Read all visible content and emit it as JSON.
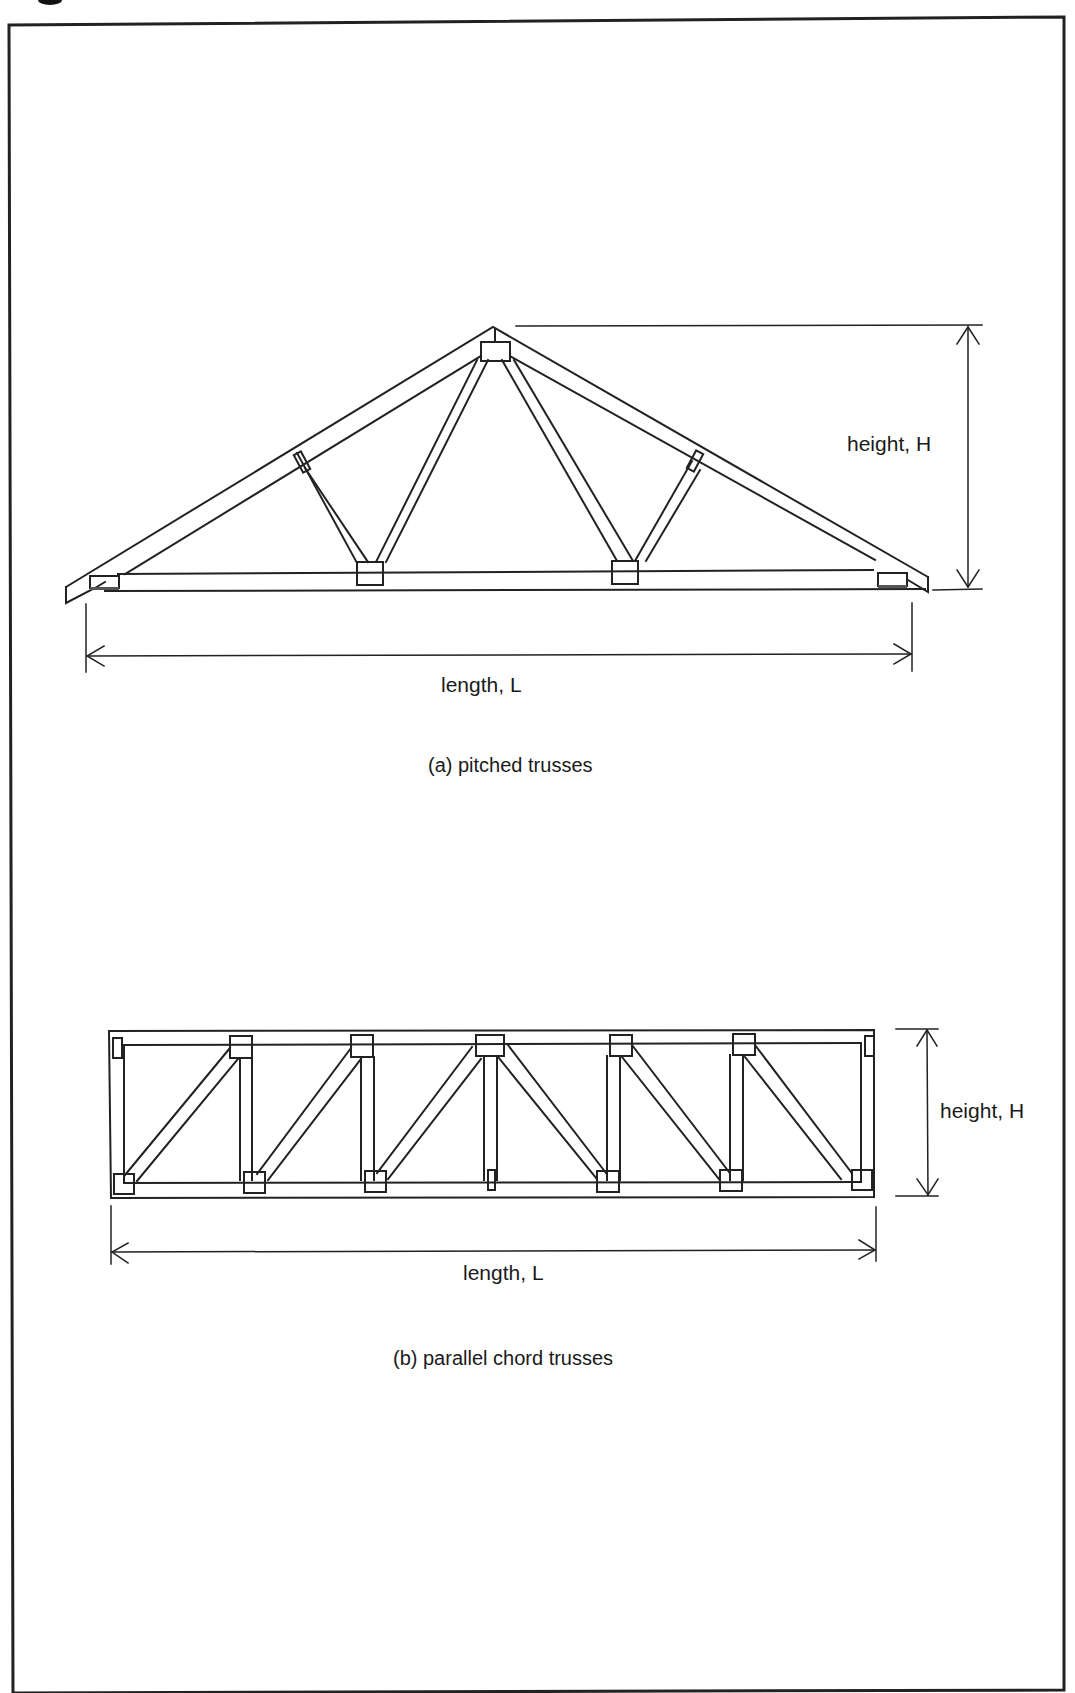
{
  "figure": {
    "frame": {
      "stroke_color": "#222222",
      "background": "#ffffff"
    },
    "panel_a": {
      "caption": "(a) pitched trusses",
      "height_label": "height, H",
      "length_label": "length, L",
      "truss_type": "pitched",
      "web_members": 4,
      "gusset_plates": 7
    },
    "panel_b": {
      "caption": "(b) parallel chord trusses",
      "height_label": "height, H",
      "length_label": "length, L",
      "truss_type": "parallel chord",
      "panels": 6,
      "gusset_plates": 16
    }
  }
}
